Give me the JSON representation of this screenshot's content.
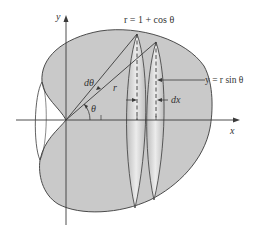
{
  "diagram": {
    "curve_equation": "r = 1 + cos θ",
    "slice_height_equation": "y = r sin θ",
    "axis_labels": {
      "x": "x",
      "y": "y"
    },
    "labels": {
      "d_theta": "dθ",
      "radius": "r",
      "theta": "θ",
      "dx": "dx"
    },
    "colors": {
      "fill": "#c9c9c9",
      "light_fill": "#e4e4e4",
      "stroke": "#3a3a3a",
      "text": "#333333"
    }
  }
}
